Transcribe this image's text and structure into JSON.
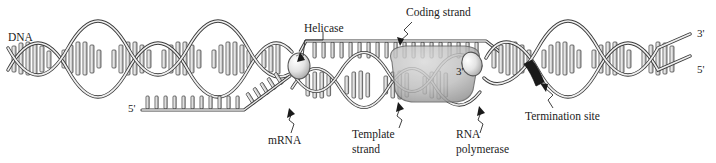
{
  "figure": {
    "background_color": "#ffffff",
    "line_color": "#2b2b2b",
    "fill_light": "#e8e8e8",
    "fill_mid": "#c4c4c4",
    "fill_dark": "#9a9a9a",
    "termination_color": "#1a1a1a",
    "width": 716,
    "height": 163
  },
  "labels": {
    "dna": "DNA",
    "helicase": "Helicase",
    "coding_strand": "Coding strand",
    "mrna": "mRNA",
    "template_strand_line1": "Template",
    "template_strand_line2": "strand",
    "rna_polymerase_line1": "RNA",
    "rna_polymerase_line2": "polymerase",
    "termination_site": "Termination site"
  },
  "prime_marks": {
    "mrna_five_prime": "5'",
    "bubble_three_prime": "3'",
    "right_three_prime": "3'",
    "right_five_prime": "5'"
  },
  "icons": {
    "helicase": "helicase-oval-icon",
    "secondary_protein": "protein-oval-icon",
    "polymerase": "rna-polymerase-blob-icon",
    "termination": "termination-band-icon",
    "arrowhead": "leader-arrow-icon"
  }
}
